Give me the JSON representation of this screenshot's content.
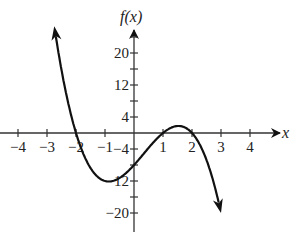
{
  "chart_data": {
    "type": "line",
    "title": "",
    "xlabel": "x",
    "ylabel": "f(x)",
    "function": "f(x) = -2(x+2)(x-1)(x-2)",
    "x_ticks": [
      -4,
      -3,
      -2,
      -1,
      1,
      2,
      3,
      4
    ],
    "x_tick_labels": [
      "−4",
      "−3",
      "−2",
      "−1",
      "1",
      "2",
      "3",
      "4"
    ],
    "y_ticks_labeled": [
      20,
      12,
      4,
      -4,
      -12,
      -20
    ],
    "y_tick_labels": [
      "20",
      "12",
      "4",
      "−4",
      "−12",
      "−20"
    ],
    "y_ticks_all": [
      24,
      20,
      16,
      12,
      8,
      4,
      -4,
      -8,
      -12,
      -16,
      -20
    ],
    "xlim": [
      -4.6,
      5.2
    ],
    "ylim": [
      -25,
      30
    ],
    "grid": false,
    "series": [
      {
        "name": "f(x)",
        "x": [
          -2.75,
          -2.5,
          -2.25,
          -2,
          -1.75,
          -1.5,
          -1.25,
          -1,
          -0.75,
          -0.5,
          -0.25,
          0,
          0.25,
          0.5,
          0.75,
          1,
          1.25,
          1.5,
          1.75,
          2,
          2.25,
          2.5,
          2.75,
          3
        ],
        "y": [
          26.7,
          15.75,
          7.78,
          0,
          -4.13,
          -6.75,
          -9.28,
          -12,
          -12.03,
          -11.25,
          -9.84,
          -8,
          -5.91,
          -3.75,
          -1.72,
          0,
          1.27,
          1.75,
          1.27,
          0,
          -2.16,
          -5.25,
          -9.4,
          -20
        ]
      }
    ],
    "roots": [
      -2,
      1,
      2
    ],
    "local_min": {
      "x": -0.8,
      "y": -12.1
    },
    "local_max": {
      "x": 1.5,
      "y": 1.75
    },
    "end_behavior": {
      "left": "arrow up",
      "right": "arrow down"
    }
  },
  "labels": {
    "x_axis": "x",
    "y_axis": "f(x)"
  }
}
